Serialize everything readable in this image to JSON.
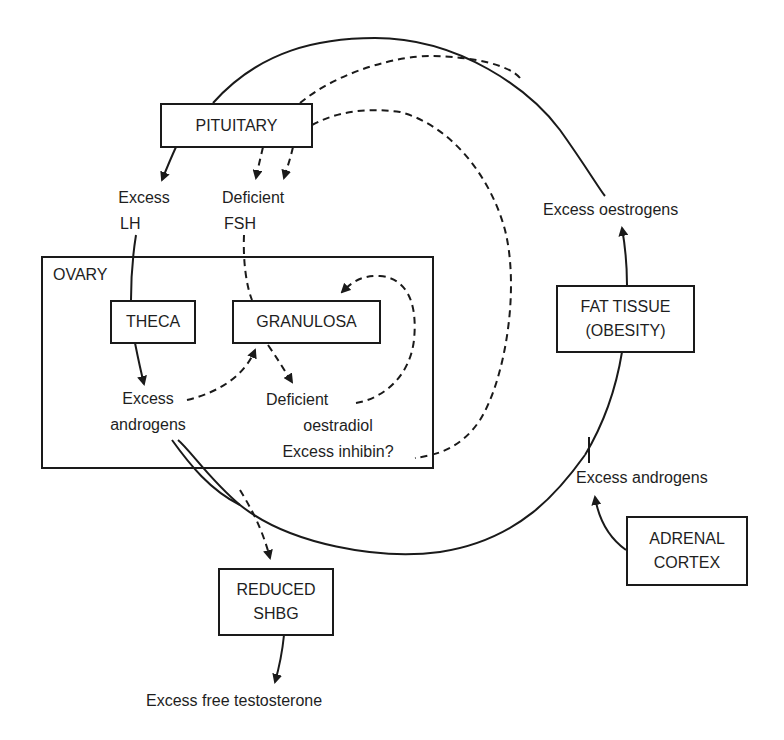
{
  "diagram": {
    "type": "flow-diagram",
    "nodes": {
      "pituitary": "PITUITARY",
      "ovary": "OVARY",
      "theca": "THECA",
      "granulosa": "GRANULOSA",
      "fat_tissue_line1": "FAT TISSUE",
      "fat_tissue_line2": "(OBESITY)",
      "adrenal_line1": "ADRENAL",
      "adrenal_line2": "CORTEX",
      "shbg_line1": "REDUCED",
      "shbg_line2": "SHBG"
    },
    "labels": {
      "excess_lh_line1": "Excess",
      "excess_lh_line2": "LH",
      "deficient_fsh_line1": "Deficient",
      "deficient_fsh_line2": "FSH",
      "ovary_androgens_line1": "Excess",
      "ovary_androgens_line2": "androgens",
      "oestradiol_line1": "Deficient",
      "oestradiol_line2": "oestradiol",
      "oestradiol_line3": "Excess inhibin?",
      "excess_oestrogens": "Excess oestrogens",
      "adrenal_androgens": "Excess androgens",
      "free_testosterone": "Excess free testosterone"
    },
    "edges": [
      {
        "from": "PITUITARY",
        "to": "Excess LH",
        "style": "solid"
      },
      {
        "from": "PITUITARY",
        "to": "Deficient FSH",
        "style": "dashed",
        "count": 2
      },
      {
        "from": "Excess LH",
        "to": "THECA",
        "style": "solid"
      },
      {
        "from": "Deficient FSH",
        "to": "GRANULOSA",
        "style": "dashed"
      },
      {
        "from": "THECA",
        "to": "Excess androgens",
        "style": "solid"
      },
      {
        "from": "Excess androgens",
        "to": "GRANULOSA",
        "style": "dashed"
      },
      {
        "from": "GRANULOSA",
        "to": "Deficient oestradiol",
        "style": "dashed"
      },
      {
        "from": "Deficient oestradiol",
        "to": "GRANULOSA",
        "style": "dashed"
      },
      {
        "from": "Excess inhibin?",
        "to": "PITUITARY",
        "style": "dashed"
      },
      {
        "from": "Excess androgens",
        "to": "REDUCED SHBG",
        "style": "dashed"
      },
      {
        "from": "REDUCED SHBG",
        "to": "Excess free testosterone",
        "style": "solid"
      },
      {
        "from": "ADRENAL CORTEX",
        "to": "Excess androgens",
        "style": "solid"
      },
      {
        "from": "Excess androgens",
        "to": "FAT TISSUE",
        "style": "solid"
      },
      {
        "from": "FAT TISSUE",
        "to": "Excess oestrogens",
        "style": "solid"
      },
      {
        "from": "Excess oestrogens",
        "to": "PITUITARY",
        "style": "solid"
      }
    ],
    "colors": {
      "line": "#1a1a1a",
      "background": "#ffffff"
    }
  }
}
